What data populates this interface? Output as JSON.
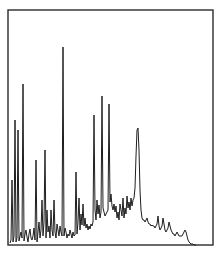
{
  "chart_data": {
    "type": "line",
    "title": "",
    "xlabel": "",
    "ylabel": "",
    "grid": false,
    "legend": null,
    "frame": {
      "left": 8,
      "top": 10,
      "right": 213,
      "bottom": 245
    },
    "line_color": "#1e1e1e",
    "frame_color": "#2b2b2b",
    "points": [
      [
        10,
        243
      ],
      [
        11,
        240
      ],
      [
        12,
        180
      ],
      [
        13,
        242
      ],
      [
        14,
        236
      ],
      [
        15,
        120
      ],
      [
        16,
        242
      ],
      [
        17,
        238
      ],
      [
        18,
        130
      ],
      [
        19,
        241
      ],
      [
        20,
        236
      ],
      [
        21,
        232
      ],
      [
        22,
        238
      ],
      [
        23,
        84
      ],
      [
        24,
        241
      ],
      [
        25,
        234
      ],
      [
        26,
        230
      ],
      [
        27,
        237
      ],
      [
        28,
        242
      ],
      [
        29,
        234
      ],
      [
        30,
        229
      ],
      [
        31,
        238
      ],
      [
        32,
        240
      ],
      [
        33,
        236
      ],
      [
        34,
        228
      ],
      [
        35,
        240
      ],
      [
        36,
        160
      ],
      [
        37,
        242
      ],
      [
        38,
        232
      ],
      [
        39,
        222
      ],
      [
        40,
        238
      ],
      [
        41,
        230
      ],
      [
        42,
        200
      ],
      [
        43,
        236
      ],
      [
        44,
        222
      ],
      [
        45,
        150
      ],
      [
        46,
        238
      ],
      [
        47,
        210
      ],
      [
        48,
        232
      ],
      [
        49,
        226
      ],
      [
        50,
        238
      ],
      [
        51,
        210
      ],
      [
        52,
        230
      ],
      [
        53,
        236
      ],
      [
        54,
        200
      ],
      [
        55,
        232
      ],
      [
        56,
        238
      ],
      [
        57,
        224
      ],
      [
        58,
        230
      ],
      [
        59,
        236
      ],
      [
        60,
        226
      ],
      [
        61,
        232
      ],
      [
        62,
        236
      ],
      [
        63,
        47
      ],
      [
        64,
        236
      ],
      [
        65,
        228
      ],
      [
        66,
        232
      ],
      [
        67,
        238
      ],
      [
        68,
        234
      ],
      [
        69,
        236
      ],
      [
        70,
        230
      ],
      [
        71,
        234
      ],
      [
        72,
        238
      ],
      [
        73,
        232
      ],
      [
        74,
        236
      ],
      [
        75,
        235
      ],
      [
        76,
        172
      ],
      [
        77,
        234
      ],
      [
        78,
        222
      ],
      [
        79,
        198
      ],
      [
        80,
        230
      ],
      [
        81,
        214
      ],
      [
        82,
        225
      ],
      [
        83,
        204
      ],
      [
        84,
        226
      ],
      [
        85,
        218
      ],
      [
        86,
        228
      ],
      [
        87,
        224
      ],
      [
        88,
        230
      ],
      [
        89,
        226
      ],
      [
        90,
        229
      ],
      [
        91,
        224
      ],
      [
        92,
        226
      ],
      [
        93,
        222
      ],
      [
        94,
        115
      ],
      [
        95,
        210
      ],
      [
        96,
        220
      ],
      [
        97,
        200
      ],
      [
        98,
        214
      ],
      [
        99,
        205
      ],
      [
        100,
        218
      ],
      [
        101,
        212
      ],
      [
        102,
        96
      ],
      [
        103,
        208
      ],
      [
        104,
        212
      ],
      [
        105,
        216
      ],
      [
        106,
        214
      ],
      [
        107,
        212
      ],
      [
        108,
        210
      ],
      [
        109,
        104
      ],
      [
        110,
        202
      ],
      [
        111,
        194
      ],
      [
        112,
        206
      ],
      [
        113,
        210
      ],
      [
        114,
        204
      ],
      [
        115,
        212
      ],
      [
        116,
        206
      ],
      [
        117,
        218
      ],
      [
        118,
        212
      ],
      [
        119,
        220
      ],
      [
        120,
        204
      ],
      [
        121,
        210
      ],
      [
        122,
        216
      ],
      [
        123,
        198
      ],
      [
        124,
        218
      ],
      [
        125,
        208
      ],
      [
        126,
        214
      ],
      [
        127,
        196
      ],
      [
        128,
        208
      ],
      [
        129,
        202
      ],
      [
        130,
        210
      ],
      [
        131,
        198
      ],
      [
        132,
        206
      ],
      [
        133,
        200
      ],
      [
        134,
        198
      ],
      [
        135,
        188
      ],
      [
        136,
        156
      ],
      [
        137,
        130
      ],
      [
        138,
        128
      ],
      [
        139,
        150
      ],
      [
        140,
        190
      ],
      [
        141,
        210
      ],
      [
        142,
        218
      ],
      [
        143,
        220
      ],
      [
        144,
        220
      ],
      [
        145,
        222
      ],
      [
        146,
        220
      ],
      [
        147,
        218
      ],
      [
        148,
        222
      ],
      [
        149,
        224
      ],
      [
        150,
        224
      ],
      [
        151,
        226
      ],
      [
        152,
        225
      ],
      [
        153,
        226
      ],
      [
        154,
        226
      ],
      [
        155,
        228
      ],
      [
        156,
        226
      ],
      [
        157,
        224
      ],
      [
        158,
        216
      ],
      [
        159,
        226
      ],
      [
        160,
        230
      ],
      [
        161,
        228
      ],
      [
        162,
        226
      ],
      [
        163,
        218
      ],
      [
        164,
        224
      ],
      [
        165,
        230
      ],
      [
        166,
        232
      ],
      [
        167,
        230
      ],
      [
        168,
        228
      ],
      [
        169,
        222
      ],
      [
        170,
        226
      ],
      [
        171,
        230
      ],
      [
        172,
        232
      ],
      [
        173,
        234
      ],
      [
        174,
        234
      ],
      [
        175,
        236
      ],
      [
        176,
        234
      ],
      [
        177,
        232
      ],
      [
        178,
        234
      ],
      [
        179,
        236
      ],
      [
        180,
        236
      ],
      [
        181,
        236
      ],
      [
        182,
        236
      ],
      [
        183,
        234
      ],
      [
        184,
        232
      ],
      [
        185,
        230
      ],
      [
        186,
        232
      ],
      [
        187,
        236
      ],
      [
        188,
        240
      ],
      [
        189,
        242
      ],
      [
        190,
        243
      ],
      [
        191,
        244
      ],
      [
        192,
        244
      ],
      [
        193,
        244
      ],
      [
        194,
        245
      ],
      [
        195,
        245
      ],
      [
        196,
        245
      ]
    ]
  }
}
